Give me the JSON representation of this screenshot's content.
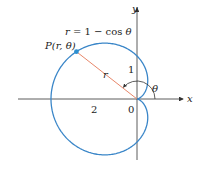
{
  "diagram": {
    "equation": "r = 1 − cos θ",
    "point_label": "P(r, θ)",
    "radius_label": "r",
    "angle_label": "θ",
    "axis_x_label": "x",
    "axis_y_label": "y",
    "tick_labels": {
      "two": "2",
      "one": "1",
      "origin": "0"
    },
    "colors": {
      "curve": "#3a86c8",
      "radius_line": "#e8876a",
      "point": "#2b8fd0",
      "axes": "#333333"
    },
    "geometry": {
      "origin_px": [
        137,
        99
      ],
      "scale_px_per_unit": 43,
      "point_theta_deg": 142
    }
  }
}
